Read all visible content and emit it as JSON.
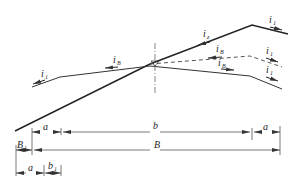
{
  "diagram": {
    "type": "road cross-section superelevation",
    "slope_labels": {
      "i1_left": "i",
      "i1_left_sub": "1",
      "iB_left": "i",
      "iB_left_sub": "B",
      "iz": "i",
      "iz_sub": "z",
      "i1_top_right": "i",
      "i1_top_right_sub": "1",
      "iB_dashed": "i",
      "iB_dashed_sub": "B",
      "i1_mid_right": "i",
      "i1_mid_right_sub": "1",
      "iB_lower": "i",
      "iB_lower_sub": "B",
      "i1_lower_right": "i",
      "i1_lower_right_sub": "1"
    },
    "dimensions": {
      "row1_a_left": "a",
      "row1_b": "b",
      "row1_a_right": "a",
      "row2_B1": "B",
      "row2_B1_sub": "1",
      "row2_B": "B",
      "row3_a": "a",
      "row3_b1": "b",
      "row3_b1_sub": "1"
    },
    "colors": {
      "line": "#222222",
      "dim_line": "#555555",
      "dashed": "#555555"
    }
  }
}
